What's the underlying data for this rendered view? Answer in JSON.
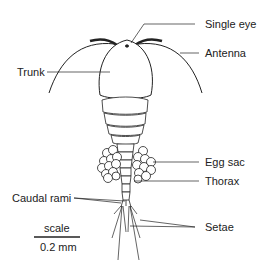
{
  "diagram": {
    "labels": {
      "single_eye": "Single eye",
      "antenna": "Antenna",
      "trunk": "Trunk",
      "egg_sac": "Egg sac",
      "thorax": "Thorax",
      "caudal_rami": "Caudal rami",
      "setae": "Setae"
    },
    "scale_bar": {
      "label": "scale",
      "value": "0.2 mm"
    }
  }
}
